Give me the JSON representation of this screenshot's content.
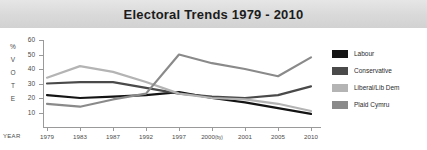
{
  "banner": {
    "title": "Electoral Trends 1979 - 2010"
  },
  "axes": {
    "y_axis_title_chars": [
      "%",
      "V",
      "O",
      "T",
      "E"
    ],
    "year_label": "YEAR"
  },
  "legend": {
    "items": [
      {
        "label": "Labour",
        "color": "#141414"
      },
      {
        "label": "Conservative",
        "color": "#4a4a4a"
      },
      {
        "label": "Liberal/Lib Dem",
        "color": "#b4b4b4"
      },
      {
        "label": "Plaid Cymru",
        "color": "#8a8a8a"
      }
    ]
  },
  "chart_data": {
    "type": "line",
    "title": "Electoral Trends 1979 - 2010",
    "xlabel": "YEAR",
    "ylabel": "% VOTE",
    "grid": false,
    "legend_position": "right",
    "categories": [
      "1979",
      "1983",
      "1987",
      "1992",
      "1997",
      "2000(by)",
      "2001",
      "2005",
      "2010"
    ],
    "category_sublabels": [
      "",
      "",
      "",
      "",
      "",
      "(by)",
      "",
      "",
      ""
    ],
    "xlim": [
      0,
      8
    ],
    "ylim": [
      0,
      60
    ],
    "yticks": [
      10,
      20,
      30,
      40,
      50,
      60
    ],
    "series": [
      {
        "name": "Labour",
        "color": "#141414",
        "values": [
          22,
          20,
          21,
          22,
          24,
          20,
          17,
          13,
          9
        ]
      },
      {
        "name": "Conservative",
        "color": "#4a4a4a",
        "values": [
          30,
          31,
          31,
          27,
          23,
          21,
          20,
          22,
          28
        ]
      },
      {
        "name": "Liberal/Lib Dem",
        "color": "#b4b4b4",
        "values": [
          34,
          42,
          38,
          31,
          23,
          20,
          19,
          16,
          11
        ]
      },
      {
        "name": "Plaid Cymru",
        "color": "#8a8a8a",
        "values": [
          16,
          14,
          19,
          23,
          50,
          44,
          40,
          35,
          48
        ]
      }
    ]
  }
}
